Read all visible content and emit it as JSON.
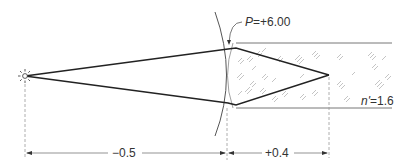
{
  "diagram": {
    "type": "optics-refraction",
    "labels": {
      "power_symbol": "P",
      "power_value": "=+6.00",
      "index_symbol": "n'",
      "index_value": "=1.6",
      "object_distance": "−0.5",
      "image_distance": "+0.4"
    },
    "elements": {
      "source": "point-light-source",
      "surface": "convex-spherical-refracting-surface",
      "medium": "glass-block"
    },
    "colors": {
      "ray": "#222222",
      "surface": "#555555",
      "dimension": "#666666",
      "hatch": "#aaaaaa"
    }
  }
}
